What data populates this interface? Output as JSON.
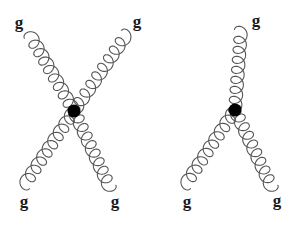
{
  "diagrams": [
    {
      "name": "four-gluon-vertex",
      "vertex": {
        "x": 74,
        "y": 111,
        "r": 6.5
      },
      "gluons": [
        {
          "from": [
            30,
            35
          ],
          "to": [
            74,
            111
          ],
          "loops": 9,
          "amp": 6.5
        },
        {
          "from": [
            127,
            34
          ],
          "to": [
            74,
            111
          ],
          "loops": 9,
          "amp": 6.5
        },
        {
          "from": [
            24,
            185
          ],
          "to": [
            74,
            111
          ],
          "loops": 9,
          "amp": 6.5
        },
        {
          "from": [
            110,
            188
          ],
          "to": [
            74,
            111
          ],
          "loops": 9,
          "amp": 6.5
        }
      ],
      "labels": [
        {
          "text": "g",
          "x": 19,
          "y": 22
        },
        {
          "text": "g",
          "x": 137,
          "y": 21
        },
        {
          "text": "g",
          "x": 24,
          "y": 201
        },
        {
          "text": "g",
          "x": 115,
          "y": 201
        }
      ]
    },
    {
      "name": "three-gluon-vertex",
      "vertex": {
        "x": 235,
        "y": 110,
        "r": 6.5
      },
      "gluons": [
        {
          "from": [
            241,
            30
          ],
          "to": [
            235,
            110
          ],
          "loops": 8,
          "amp": 6.5
        },
        {
          "from": [
            185,
            185
          ],
          "to": [
            235,
            110
          ],
          "loops": 9,
          "amp": 6.5
        },
        {
          "from": [
            272,
            188
          ],
          "to": [
            235,
            110
          ],
          "loops": 9,
          "amp": 6.5
        }
      ],
      "labels": [
        {
          "text": "g",
          "x": 256,
          "y": 20
        },
        {
          "text": "g",
          "x": 187,
          "y": 201
        },
        {
          "text": "g",
          "x": 277,
          "y": 200
        }
      ]
    }
  ],
  "style": {
    "gluon_color": "#555555",
    "vertex_color": "#000000",
    "label_color": "#1a1a1a",
    "background": "#ffffff"
  }
}
